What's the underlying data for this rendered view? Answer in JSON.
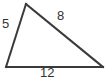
{
  "figure": {
    "type": "geometry-diagram",
    "shape": "triangle",
    "background_color": "#ffffff",
    "stroke_color": "#3a3a3a",
    "stroke_width": 2,
    "label_color": "#333333",
    "vertices": {
      "apex": {
        "x": 26,
        "y": 4
      },
      "bottom_left": {
        "x": 6,
        "y": 67
      },
      "bottom_right": {
        "x": 103,
        "y": 67
      }
    },
    "sides": [
      {
        "name": "left-side",
        "label": "5",
        "from": "bottom_left",
        "to": "apex"
      },
      {
        "name": "hypotenuse-side",
        "label": "8",
        "from": "apex",
        "to": "bottom_right"
      },
      {
        "name": "base-side",
        "label": "12",
        "from": "bottom_left",
        "to": "bottom_right"
      }
    ],
    "labels": {
      "left": "5",
      "hypotenuse": "8",
      "base": "12"
    }
  },
  "chart_data": {
    "type": "diagram",
    "title": "",
    "categories": [
      "left side",
      "upper right side",
      "base"
    ],
    "values": [
      5,
      8,
      12
    ],
    "annotations": [
      "5",
      "8",
      "12"
    ]
  }
}
